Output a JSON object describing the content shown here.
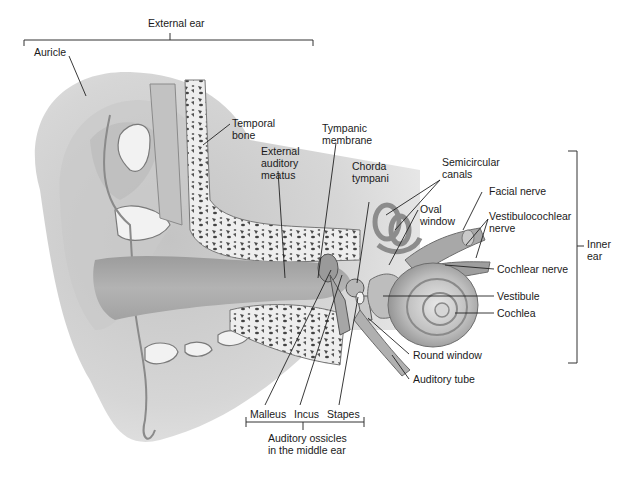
{
  "diagram": {
    "groups": {
      "external_ear": "External ear",
      "inner_ear": "Inner\near",
      "ossicles": "Auditory ossicles\nin the middle ear"
    },
    "labels": {
      "auricle": "Auricle",
      "temporal_bone": "Temporal\nbone",
      "external_auditory_meatus": "External\nauditory\nmeatus",
      "tympanic_membrane": "Tympanic\nmembrane",
      "chorda_tympani": "Chorda\ntympani",
      "semicircular_canals": "Semicircular\ncanals",
      "oval_window": "Oval\nwindow",
      "facial_nerve": "Facial nerve",
      "vestibulocochlear_nerve": "Vestibulocochlear\nnerve",
      "cochlear_nerve": "Cochlear nerve",
      "vestibule": "Vestibule",
      "cochlea": "Cochlea",
      "round_window": "Round window",
      "auditory_tube": "Auditory tube",
      "malleus": "Malleus",
      "incus": "Incus",
      "stapes": "Stapes"
    },
    "colors": {
      "skin_light": "#d9d9d9",
      "skin_mid": "#b5b5b5",
      "skin_dark": "#8f8f8f",
      "bone": "#eeeeee",
      "bone_spots": "#555555",
      "line": "#222222"
    }
  }
}
